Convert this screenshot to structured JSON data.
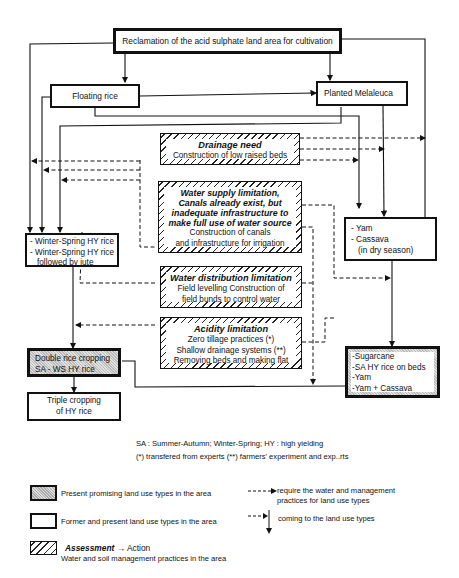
{
  "diagram": {
    "root": "Reclamation of the acid sulphate land area for cultivation",
    "floating_rice": "Floating rice",
    "planted_melaleuca": "Planted Melaleuca",
    "winter_spring": [
      "- Winter-Spring HY rice",
      "- Winter-Spring HY rice",
      "followed by jute"
    ],
    "yam_cassava": [
      "- Yam",
      "- Cassava",
      "(in dry season)"
    ],
    "double_rice": [
      "Double rice cropping",
      "SA - WS HY rice"
    ],
    "triple_cropping": [
      "Triple cropping",
      "of HY rice"
    ],
    "sugarcane_box": [
      "-Sugarcane",
      "-SA HY rice on beds",
      "-Yam",
      "-Yam + Cassava"
    ],
    "assessments": [
      {
        "title": "Drainage need",
        "actions": [
          "Construction of low raised beds"
        ]
      },
      {
        "title": "Water supply limitation, Canals already exist, but inadequate infrastructure to make full use of water source",
        "actions": [
          "Construction of canals",
          "and infrastructure for irrigation"
        ]
      },
      {
        "title": "Water distribution limitation",
        "actions": [
          "Field levelling Construction of",
          "field bunds to control water"
        ]
      },
      {
        "title": "Acidity limitation",
        "actions": [
          "Zero tillage practices (*)",
          "Shallow drainage systems (**)",
          "Removing beds and making flat"
        ]
      }
    ]
  },
  "notes": {
    "abbrev": "SA : Summer-Autumn; Winter-Spring; HY : high yielding",
    "sources": "(*) transfered from experts (**) farmers' experiment and exp..rts"
  },
  "legend": {
    "shaded": "Present promising land use types in the area",
    "plain": "Former and present land use types in the area",
    "hatched_title": "Assessment",
    "hatched_arrow": "→ Action",
    "hatched_sub": "Water and soil management practices in the area",
    "dashed_arrow": [
      "require the water and management",
      "practices for land use types"
    ],
    "coming_arrow": "coming to the land use types"
  },
  "colors": {
    "line": "#111111",
    "shade": "#c8c8c8",
    "background": "#ffffff"
  }
}
